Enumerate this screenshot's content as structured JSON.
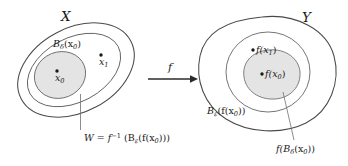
{
  "diagram": {
    "background_color": "#ffffff",
    "stroke_color": "#4a4a4a",
    "shade_color": "#e4e4e4",
    "dot_color": "#1a1a1a",
    "domain": {
      "set_label": "X",
      "shaded_ball_label_base": "B",
      "shaded_ball_label_sub": "δ",
      "shaded_ball_label_arg": "(x",
      "shaded_ball_label_arg_sub": "0",
      "shaded_ball_label_close": ")",
      "center_point_base": "x",
      "center_point_sub": "0",
      "other_point_base": "x",
      "other_point_sub": "1",
      "preimage_label_lhs": "W = f",
      "preimage_label_sup": "−1",
      "preimage_label_open": " (B",
      "preimage_label_eps": "ε",
      "preimage_label_mid": "(f(x",
      "preimage_label_sub0": "0",
      "preimage_label_close": ")))"
    },
    "map": {
      "arrow_label": "f"
    },
    "codomain": {
      "set_label": "Y",
      "eps_ball_label_base": "B",
      "eps_ball_label_sub": "ε",
      "eps_ball_label_mid": "(f(x",
      "eps_ball_label_sub0": "0",
      "eps_ball_label_close": "))",
      "image_center_label": "f(x",
      "image_center_label_sub": "0",
      "image_center_label_close": ")",
      "image_other_label": "f(x",
      "image_other_label_sub": "1",
      "image_other_label_close": ")",
      "image_ball_label_open": "f(B",
      "image_ball_label_sub": "δ",
      "image_ball_label_mid": "(x",
      "image_ball_label_sub0": "0",
      "image_ball_label_close": "))"
    }
  }
}
